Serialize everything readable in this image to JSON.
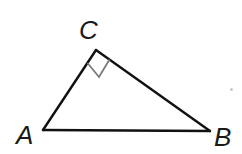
{
  "figure": {
    "type": "right-triangle",
    "vertices": [
      {
        "name": "A",
        "x": 43,
        "y": 130
      },
      {
        "name": "B",
        "x": 210,
        "y": 131
      },
      {
        "name": "C",
        "x": 96,
        "y": 50
      }
    ],
    "labels": {
      "A": "A",
      "B": "B",
      "C": "C"
    },
    "right_angle_at": "C",
    "colors": {
      "stroke": "#111111",
      "right_angle_marker": "#7a7a7a",
      "label": "#1a1a1a"
    }
  }
}
